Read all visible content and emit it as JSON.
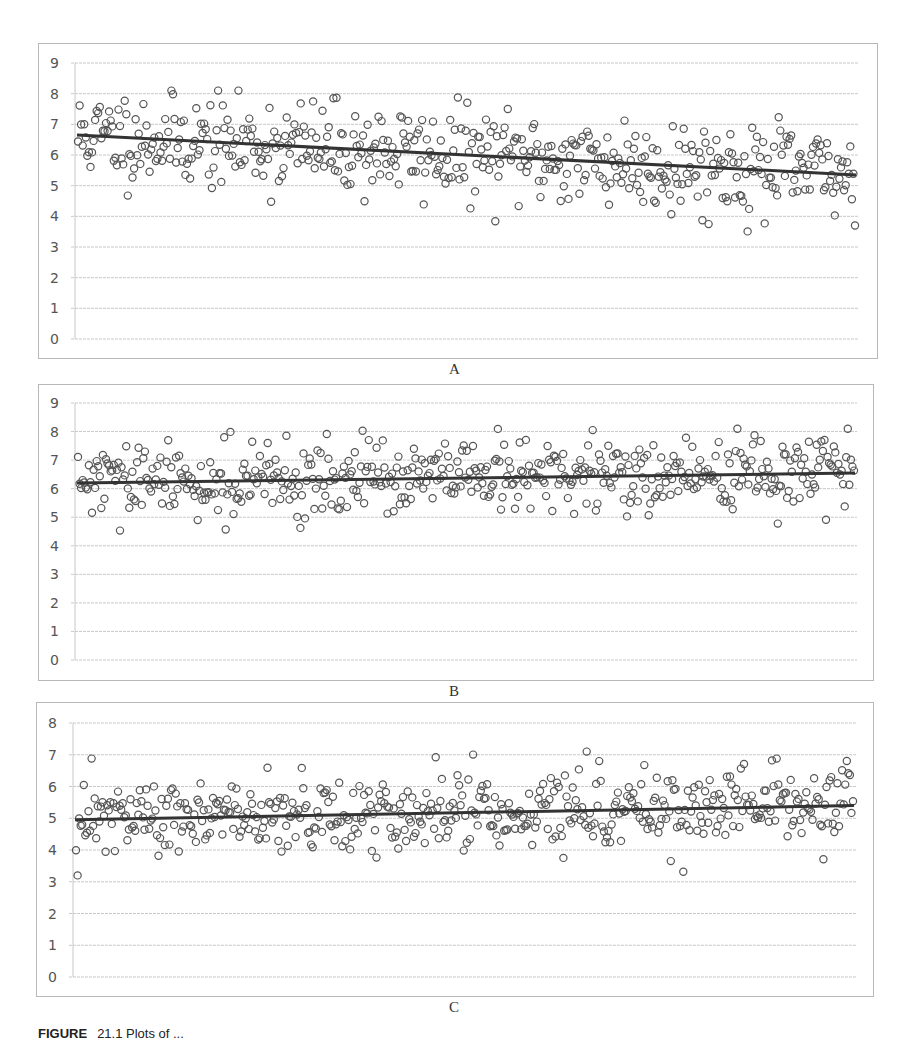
{
  "figure": {
    "caption_prefix": "FIGURE",
    "caption_rest": "21.1   Plots of ..."
  },
  "chart_data": [
    {
      "type": "scatter",
      "panel_label": "A",
      "title": "",
      "xlabel": "",
      "ylabel": "",
      "ylim": [
        0,
        9
      ],
      "yticks": [
        "0",
        "1",
        "2",
        "3",
        "4",
        "5",
        "6",
        "7",
        "8",
        "9"
      ],
      "grid": true,
      "legend": "none",
      "marker": "open-circle",
      "trend": {
        "type": "linear",
        "start": 6.65,
        "end": 5.35
      },
      "frame": {
        "left": 38,
        "top": 43,
        "width": 840,
        "height": 316
      },
      "plot": {
        "left": 75,
        "right": 858,
        "y_top": 63,
        "y_bottom": 339
      },
      "n_points_approx": 500,
      "seed": 11,
      "spread": 0.75
    },
    {
      "type": "scatter",
      "panel_label": "B",
      "title": "",
      "xlabel": "",
      "ylabel": "",
      "ylim": [
        0,
        9
      ],
      "yticks": [
        "0",
        "1",
        "2",
        "3",
        "4",
        "5",
        "6",
        "7",
        "8",
        "9"
      ],
      "grid": true,
      "legend": "none",
      "marker": "open-circle",
      "trend": {
        "type": "linear",
        "start": 6.2,
        "end": 6.55
      },
      "frame": {
        "left": 38,
        "top": 384,
        "width": 836,
        "height": 297
      },
      "plot": {
        "left": 75,
        "right": 857,
        "y_top": 403,
        "y_bottom": 660
      },
      "n_points_approx": 500,
      "seed": 29,
      "spread": 0.65
    },
    {
      "type": "scatter",
      "panel_label": "C",
      "title": "",
      "xlabel": "",
      "ylabel": "",
      "ylim": [
        0,
        8
      ],
      "yticks": [
        "0",
        "1",
        "2",
        "3",
        "4",
        "5",
        "6",
        "7",
        "8"
      ],
      "grid": true,
      "legend": "none",
      "marker": "open-circle",
      "trend": {
        "type": "linear",
        "start": 4.95,
        "end": 5.4
      },
      "frame": {
        "left": 36,
        "top": 702,
        "width": 838,
        "height": 295
      },
      "plot": {
        "left": 73,
        "right": 856,
        "y_top": 723,
        "y_bottom": 977
      },
      "n_points_approx": 500,
      "seed": 47,
      "spread": 0.6
    }
  ],
  "style": {
    "marker_color": "#555555",
    "trend_color": "#333333",
    "grid_color": "#c8c8c8",
    "frame_color": "#b8b8b8",
    "tick_color": "#555555"
  }
}
